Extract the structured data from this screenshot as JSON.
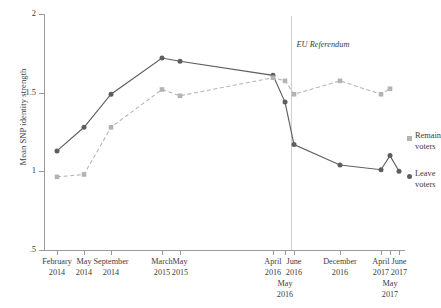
{
  "chart_data": {
    "type": "line",
    "title": "",
    "xlabel": "",
    "ylabel": "Mean SNP identity strength",
    "ylim": [
      0.5,
      2
    ],
    "ytick_labels": [
      ".5",
      "1",
      "1.5",
      "2"
    ],
    "ytick_values": [
      0.5,
      1,
      1.5,
      2
    ],
    "grid": false,
    "legend_position": "right",
    "categories": [
      "February 2014",
      "May 2014",
      "September 2014",
      "March 2015",
      "May 2015",
      "April 2016",
      "May 2016",
      "June 2016",
      "December 2016",
      "April 2017",
      "May 2017",
      "June 2017"
    ],
    "x_tick_labels": [
      {
        "top": "February",
        "bottom": "2014",
        "offset": "none"
      },
      {
        "top": "May",
        "bottom": "2014",
        "offset": "none"
      },
      {
        "top": "September",
        "bottom": "2014",
        "offset": "none"
      },
      {
        "top": "March",
        "bottom": "2015",
        "offset": "none"
      },
      {
        "top": "May",
        "bottom": "2015",
        "offset": "none"
      },
      {
        "top": "April",
        "bottom": "2016",
        "offset": "none"
      },
      {
        "top": "May",
        "bottom": "2016",
        "offset": "down"
      },
      {
        "top": "June",
        "bottom": "2016",
        "offset": "none"
      },
      {
        "top": "December",
        "bottom": "2016",
        "offset": "none"
      },
      {
        "top": "April",
        "bottom": "2017",
        "offset": "none"
      },
      {
        "top": "May",
        "bottom": "2017",
        "offset": "down"
      },
      {
        "top": "June",
        "bottom": "2017",
        "offset": "none"
      }
    ],
    "series": [
      {
        "name": "Leave voters",
        "legend_line1": "Leave",
        "legend_line2": "voters",
        "color": "#5e5e5e",
        "marker": "circle",
        "dash": "solid",
        "values": [
          1.13,
          1.28,
          1.49,
          1.72,
          1.7,
          1.61,
          1.44,
          1.17,
          1.04,
          1.01,
          1.1,
          1.0
        ]
      },
      {
        "name": "Remain voters",
        "legend_line1": "Remain",
        "legend_line2": "voters",
        "color": "#b3b3b3",
        "marker": "square",
        "dash": "dashed",
        "values": [
          0.965,
          0.98,
          1.28,
          1.52,
          1.48,
          1.595,
          1.575,
          1.49,
          1.575,
          1.49,
          1.525,
          null
        ]
      }
    ],
    "annotations": [
      {
        "text": "EU Referendum",
        "category_index": 7,
        "style": "italic"
      }
    ]
  }
}
